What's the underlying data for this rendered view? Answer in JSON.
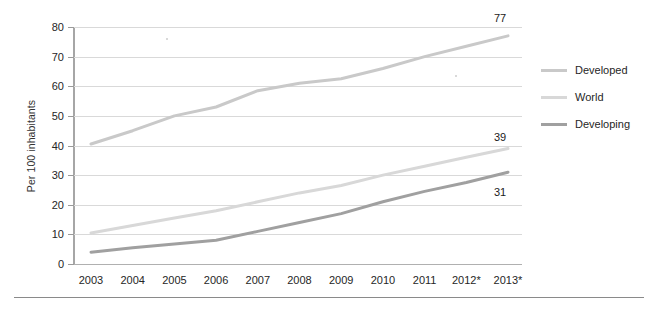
{
  "chart_data": {
    "type": "line",
    "title": "",
    "xlabel": "",
    "ylabel": "Per 100 inhabitants",
    "ylim": [
      0,
      80
    ],
    "ytick_labels": [
      "0",
      "10",
      "20",
      "30",
      "40",
      "50",
      "60",
      "70",
      "80"
    ],
    "yticks": [
      0,
      10,
      20,
      30,
      40,
      50,
      60,
      70,
      80
    ],
    "grid": true,
    "legend_position": "right",
    "categories": [
      "2003",
      "2004",
      "2005",
      "2006",
      "2007",
      "2008",
      "2009",
      "2010",
      "2011",
      "2012*",
      "2013*"
    ],
    "x": [
      2003,
      2004,
      2005,
      2006,
      2007,
      2008,
      2009,
      2010,
      2011,
      2012,
      2013
    ],
    "series": [
      {
        "name": "Developed",
        "color": "#c9c9c9",
        "values": [
          40.5,
          45.0,
          50.0,
          53.0,
          58.5,
          61.0,
          62.5,
          66.0,
          70.0,
          73.5,
          77.0
        ],
        "end_label": "77"
      },
      {
        "name": "World",
        "color": "#d8d8d8",
        "values": [
          10.5,
          13.0,
          15.5,
          18.0,
          21.0,
          24.0,
          26.5,
          30.0,
          33.0,
          36.0,
          39.0
        ],
        "end_label": "39"
      },
      {
        "name": "Developing",
        "color": "#a0a0a0",
        "values": [
          4.0,
          5.5,
          6.8,
          8.0,
          11.0,
          14.0,
          17.0,
          21.0,
          24.5,
          27.5,
          31.0
        ],
        "end_label": "31"
      }
    ],
    "annotations": [
      {
        "text": "77",
        "series": "Developed",
        "x": "2013*"
      },
      {
        "text": "39",
        "series": "World",
        "x": "2013*"
      },
      {
        "text": "31",
        "series": "Developing",
        "x": "2013*"
      }
    ]
  },
  "legend": {
    "items": [
      {
        "label": "Developed",
        "color": "#c9c9c9"
      },
      {
        "label": "World",
        "color": "#d8d8d8"
      },
      {
        "label": "Developing",
        "color": "#a0a0a0"
      }
    ]
  },
  "axes": {
    "y_title": "Per 100 inhabitants",
    "y_labels": [
      "80",
      "70",
      "60",
      "50",
      "40",
      "30",
      "20",
      "10",
      "0"
    ],
    "x_labels": [
      "2003",
      "2004",
      "2005",
      "2006",
      "2007",
      "2008",
      "2009",
      "2010",
      "2011",
      "2012*",
      "2013*"
    ]
  },
  "endpoint_labels": {
    "developed": "77",
    "world": "39",
    "developing": "31"
  }
}
